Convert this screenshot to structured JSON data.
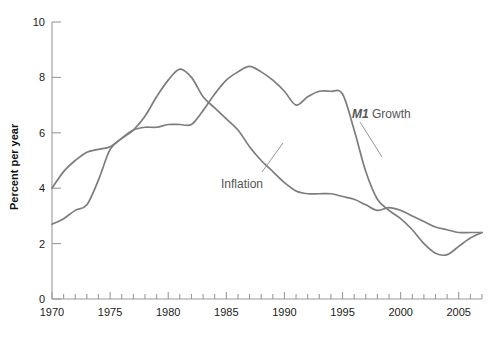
{
  "chart_data": {
    "type": "line",
    "title": "",
    "xlabel": "",
    "ylabel": "Percent per year",
    "xlim": [
      1970,
      2007
    ],
    "ylim": [
      0,
      10
    ],
    "grid": false,
    "legend_position": "inline-annotations",
    "y_ticks": [
      0,
      2,
      4,
      6,
      8,
      10
    ],
    "y_tick_labels": [
      "0",
      "2",
      "4",
      "6",
      "8",
      "10"
    ],
    "x_ticks": [
      1970,
      1975,
      1980,
      1985,
      1990,
      1995,
      2000,
      2005
    ],
    "x_tick_labels": [
      "1970",
      "1975",
      "1980",
      "1985",
      "1990",
      "1995",
      "2000",
      "2005"
    ],
    "x_minor_tick_interval": 1,
    "x": [
      1970,
      1971,
      1972,
      1973,
      1974,
      1975,
      1976,
      1977,
      1978,
      1979,
      1980,
      1981,
      1982,
      1983,
      1984,
      1985,
      1986,
      1987,
      1988,
      1989,
      1990,
      1991,
      1992,
      1993,
      1994,
      1995,
      1996,
      1997,
      1998,
      1999,
      2000,
      2001,
      2002,
      2003,
      2004,
      2005,
      2006,
      2007
    ],
    "series": [
      {
        "name": "Inflation",
        "color": "#7d7d7d",
        "values": [
          4.0,
          4.6,
          5.0,
          5.3,
          5.4,
          5.5,
          5.8,
          6.1,
          6.6,
          7.3,
          7.9,
          8.3,
          8.0,
          7.3,
          6.9,
          6.5,
          6.1,
          5.5,
          5.0,
          4.6,
          4.2,
          3.9,
          3.8,
          3.8,
          3.8,
          3.7,
          3.6,
          3.4,
          3.2,
          3.3,
          3.2,
          3.0,
          2.8,
          2.6,
          2.5,
          2.4,
          2.4,
          2.4
        ],
        "label_annotation": "Inflation"
      },
      {
        "name": "M1 Growth",
        "color": "#7d7d7d",
        "values": [
          2.7,
          2.9,
          3.2,
          3.4,
          4.3,
          5.4,
          5.8,
          6.1,
          6.2,
          6.2,
          6.3,
          6.3,
          6.3,
          6.8,
          7.4,
          7.9,
          8.2,
          8.4,
          8.2,
          7.9,
          7.5,
          7.0,
          7.3,
          7.5,
          7.5,
          7.4,
          6.1,
          4.6,
          3.6,
          3.2,
          2.9,
          2.5,
          2.0,
          1.65,
          1.6,
          1.9,
          2.2,
          2.4
        ],
        "label_annotation": "M1 Growth"
      }
    ],
    "annotations": [
      {
        "text_em": "M1",
        "text": " Growth",
        "series": "M1 Growth"
      },
      {
        "text": "Inflation",
        "series": "Inflation"
      }
    ]
  },
  "labels": {
    "y_axis_title": "Percent per year",
    "m1_growth_em": "M1",
    "m1_growth_rest": " Growth",
    "inflation": "Inflation"
  }
}
